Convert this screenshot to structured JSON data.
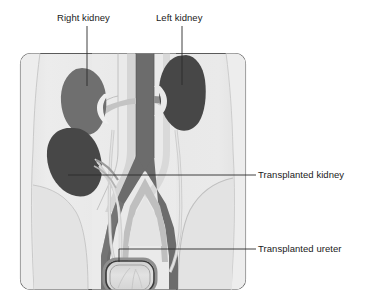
{
  "figure": {
    "type": "medical-illustration",
    "background_color": "#ffffff",
    "frame": {
      "fill": "#e8e8e8",
      "stroke": "#5a5a5a",
      "x": 20,
      "y": 53,
      "width": 226,
      "height": 237,
      "corner_radius": 10
    },
    "palette": {
      "body_fill": "#e6e6e6",
      "body_light": "#efefef",
      "pelvis_shade": "#dcdcdc",
      "native_kidney_right": "#6f6f6f",
      "native_kidney_left": "#474747",
      "transplanted_kidney": "#474747",
      "vessel_dark": "#6c6c6c",
      "vessel_mid": "#8f8f8f",
      "vessel_light": "#c8c8c8",
      "ureter": "#d8d8d8",
      "bladder_outline": "#3a3a3a",
      "bladder_fill": "#dadada",
      "leader_line": "#2b2b2b",
      "label_text": "#1a1a1a"
    }
  },
  "labels": {
    "right_kidney": "Right kidney",
    "left_kidney": "Left kidney",
    "transplanted_kidney": "Transplanted kidney",
    "transplanted_ureter": "Transplanted ureter"
  },
  "leaders": {
    "right_kidney": {
      "orientation": "vertical",
      "x": 87,
      "y1": 26,
      "y2": 86
    },
    "left_kidney": {
      "orientation": "vertical",
      "x": 182,
      "y1": 26,
      "y2": 85
    },
    "transplanted_kidney": {
      "orientation": "horizontal",
      "y": 175,
      "x1": 68,
      "x2": 256
    },
    "transplanted_ureter": {
      "orientation": "horizontal-elbow",
      "y": 249,
      "x1": 101,
      "x2": 256
    }
  },
  "structures": [
    {
      "name": "right-kidney",
      "label": "Right kidney",
      "side": "right",
      "status": "native",
      "shade": "medium-gray"
    },
    {
      "name": "left-kidney",
      "label": "Left kidney",
      "side": "left",
      "status": "native",
      "shade": "dark-gray"
    },
    {
      "name": "transplanted-kidney",
      "label": "Transplanted kidney",
      "side": "right-pelvis",
      "status": "graft",
      "shade": "dark-gray"
    },
    {
      "name": "transplanted-ureter",
      "label": "Transplanted ureter",
      "status": "graft",
      "shade": "light-gray"
    },
    {
      "name": "abdominal-aorta",
      "label": "",
      "status": "native",
      "shade": "dark-gray"
    },
    {
      "name": "inferior-vena-cava",
      "label": "",
      "status": "native",
      "shade": "light-gray"
    },
    {
      "name": "iliac-vessels",
      "label": "",
      "status": "native",
      "shade": "mixed-gray"
    },
    {
      "name": "native-ureters",
      "label": "",
      "status": "native",
      "shade": "light-gray"
    },
    {
      "name": "bladder",
      "label": "",
      "status": "native",
      "shade": "light-gray"
    }
  ]
}
